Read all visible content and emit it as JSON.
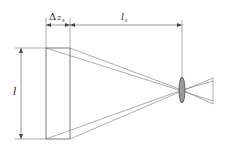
{
  "diagram": {
    "type": "optical-geometry",
    "colors": {
      "line": "#555555",
      "lens_fill": "#999999",
      "lens_stroke": "#444444",
      "text": "#333333"
    },
    "labels": {
      "height": "l",
      "delta_symbol": "Δ",
      "delta_var": "z",
      "delta_sub": "s",
      "distance_var": "l",
      "distance_sub": "s"
    },
    "elements": [
      {
        "id": "object-plane-front",
        "description": "left vertical plane"
      },
      {
        "id": "object-plane-back",
        "description": "right vertical plane offset by Δz_s"
      },
      {
        "id": "lens",
        "description": "ellipse lens at distance l_s"
      },
      {
        "id": "rays",
        "description": "converging ray lines to lens and diverging beyond"
      }
    ]
  }
}
